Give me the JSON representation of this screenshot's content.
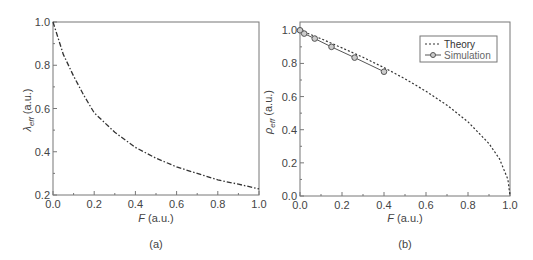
{
  "chart_data": [
    {
      "type": "line",
      "panel": "(a)",
      "xlabel": "F (a.u.)",
      "ylabel": "λ_eff (a.u.)",
      "xlim": [
        0.0,
        1.0
      ],
      "ylim": [
        0.2,
        1.0
      ],
      "xticks": [
        "0.0",
        "0.2",
        "0.4",
        "0.6",
        "0.8",
        "1.0"
      ],
      "yticks": [
        "0.2",
        "0.4",
        "0.6",
        "0.8",
        "1.0"
      ],
      "grid": false,
      "series": [
        {
          "name": "λ_eff",
          "style": "dash-dot",
          "x": [
            0.0,
            0.05,
            0.1,
            0.15,
            0.2,
            0.3,
            0.4,
            0.5,
            0.6,
            0.7,
            0.8,
            0.9,
            1.0
          ],
          "y": [
            1.0,
            0.85,
            0.75,
            0.66,
            0.58,
            0.49,
            0.42,
            0.37,
            0.33,
            0.3,
            0.27,
            0.25,
            0.228
          ]
        }
      ]
    },
    {
      "type": "line",
      "panel": "(b)",
      "xlabel": "F (a.u.)",
      "ylabel": "ρ_eff (a.u.)",
      "xlim": [
        0.0,
        1.0
      ],
      "ylim": [
        0.0,
        1.05
      ],
      "xticks": [
        "0.0",
        "0.2",
        "0.4",
        "0.6",
        "0.8",
        "1.0"
      ],
      "yticks": [
        "0.0",
        "0.2",
        "0.4",
        "0.6",
        "0.8",
        "1.0"
      ],
      "grid": false,
      "legend_position": "upper right",
      "series": [
        {
          "name": "Theory",
          "style": "dotted",
          "x": [
            0.0,
            0.1,
            0.2,
            0.3,
            0.4,
            0.5,
            0.6,
            0.7,
            0.8,
            0.9,
            0.95,
            0.99,
            1.0
          ],
          "y": [
            1.0,
            0.949,
            0.894,
            0.837,
            0.775,
            0.707,
            0.632,
            0.548,
            0.447,
            0.316,
            0.224,
            0.1,
            0.0
          ]
        },
        {
          "name": "Simulation",
          "style": "solid-circle-markers",
          "x": [
            0.0,
            0.02,
            0.07,
            0.15,
            0.26,
            0.4
          ],
          "y": [
            1.0,
            0.98,
            0.95,
            0.9,
            0.835,
            0.75
          ]
        }
      ]
    }
  ],
  "panels": {
    "a": {
      "label": "(a)",
      "xlabel_var": "F",
      "xlabel_unit": " (a.u.)",
      "ylabel_var": "λ",
      "ylabel_sub": "eff",
      "ylabel_unit": " (a.u.)"
    },
    "b": {
      "label": "(b)",
      "xlabel_var": "F",
      "xlabel_unit": " (a.u.)",
      "ylabel_var": "ρ",
      "ylabel_sub": "eff",
      "ylabel_unit": " (a.u.)"
    }
  },
  "legend": {
    "theory": "Theory",
    "simulation": "Simulation"
  }
}
